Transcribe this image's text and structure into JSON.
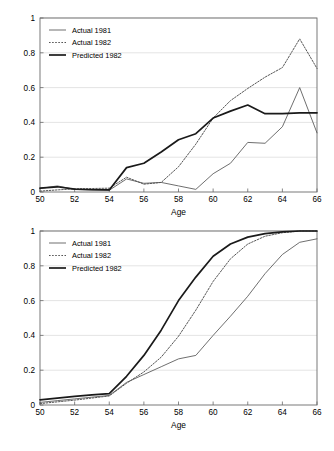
{
  "figure": {
    "caption_fragment": ""
  },
  "chart_data": [
    {
      "id": "top",
      "type": "line",
      "title": "",
      "xlabel": "Age",
      "ylabel": "",
      "xlim": [
        50,
        66
      ],
      "ylim": [
        0,
        1
      ],
      "xticks": [
        50,
        52,
        54,
        56,
        58,
        60,
        62,
        64,
        66
      ],
      "xtick_labels": [
        "50",
        "52",
        "54",
        "56",
        "58",
        "60",
        "62",
        "64",
        "66"
      ],
      "yticks": [
        0,
        0.2,
        0.4,
        0.6,
        0.8,
        1
      ],
      "ytick_labels": [
        "0",
        "0.2",
        "0.4",
        "0.6",
        "0.8",
        "1"
      ],
      "grid": "horizontal",
      "legend_position": "top-left",
      "x": [
        50,
        51,
        52,
        53,
        54,
        55,
        56,
        57,
        58,
        59,
        60,
        61,
        62,
        63,
        64,
        65,
        66
      ],
      "series": [
        {
          "name": "Actual 1981",
          "style": "thin-solid",
          "color": "#555555",
          "values": [
            0.02,
            0.035,
            0.015,
            0.012,
            0.01,
            0.075,
            0.05,
            0.055,
            0.035,
            0.015,
            0.105,
            0.165,
            0.285,
            0.28,
            0.375,
            0.6,
            0.34
          ]
        },
        {
          "name": "Actual 1982",
          "style": "dotted",
          "color": "#555555",
          "values": [
            0.005,
            0.012,
            0.018,
            0.02,
            0.022,
            0.085,
            0.045,
            0.055,
            0.145,
            0.275,
            0.425,
            0.525,
            0.595,
            0.66,
            0.715,
            0.88,
            0.71
          ]
        },
        {
          "name": "Predicted 1982",
          "style": "thick-solid",
          "color": "#1a1a1a",
          "values": [
            0.022,
            0.03,
            0.016,
            0.013,
            0.012,
            0.14,
            0.165,
            0.23,
            0.3,
            0.335,
            0.425,
            0.465,
            0.5,
            0.45,
            0.45,
            0.455,
            0.455
          ]
        }
      ]
    },
    {
      "id": "bottom",
      "type": "line",
      "title": "",
      "xlabel": "Age",
      "ylabel": "",
      "xlim": [
        50,
        66
      ],
      "ylim": [
        0,
        1
      ],
      "xticks": [
        50,
        52,
        54,
        56,
        58,
        60,
        62,
        64,
        66
      ],
      "xtick_labels": [
        "50",
        "52",
        "54",
        "56",
        "58",
        "60",
        "62",
        "64",
        "66"
      ],
      "yticks": [
        0,
        0.2,
        0.4,
        0.6,
        0.8,
        1
      ],
      "ytick_labels": [
        "0",
        "0.2",
        "0.4",
        "0.6",
        "0.8",
        "1"
      ],
      "grid": "horizontal",
      "legend_position": "top-left",
      "x": [
        50,
        51,
        52,
        53,
        54,
        55,
        56,
        57,
        58,
        59,
        60,
        61,
        62,
        63,
        64,
        65,
        66
      ],
      "series": [
        {
          "name": "Actual 1981",
          "style": "thin-solid",
          "color": "#555555",
          "values": [
            0.015,
            0.025,
            0.035,
            0.045,
            0.055,
            0.13,
            0.175,
            0.22,
            0.265,
            0.285,
            0.4,
            0.51,
            0.625,
            0.755,
            0.865,
            0.935,
            0.955
          ]
        },
        {
          "name": "Actual 1982",
          "style": "dotted",
          "color": "#555555",
          "values": [
            0.008,
            0.018,
            0.028,
            0.04,
            0.052,
            0.125,
            0.19,
            0.275,
            0.395,
            0.545,
            0.71,
            0.84,
            0.925,
            0.97,
            0.99,
            1.0,
            1.0
          ]
        },
        {
          "name": "Predicted 1982",
          "style": "thick-solid",
          "color": "#1a1a1a",
          "values": [
            0.03,
            0.04,
            0.05,
            0.058,
            0.065,
            0.165,
            0.285,
            0.43,
            0.6,
            0.735,
            0.855,
            0.925,
            0.965,
            0.985,
            0.995,
            1.0,
            1.0
          ]
        }
      ]
    }
  ]
}
